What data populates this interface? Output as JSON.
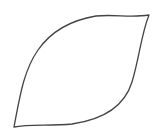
{
  "canvas": {
    "width": 158,
    "height": 140,
    "background": "#ffffff"
  },
  "shape": {
    "type": "leaf-outline",
    "stroke": "#444444",
    "stroke_width": 1.3,
    "fill": "none",
    "tips": {
      "top_right": [
        149,
        15
      ],
      "bottom_left": [
        14,
        127
      ]
    },
    "path": "M14,127 C20,95 24,70 38,50 C52,30 72,20 96,16 C115,14 130,18 149,15 C141,35 140,55 132,82 C124,108 100,120 72,124 C50,126 28,124 14,127 Z"
  }
}
